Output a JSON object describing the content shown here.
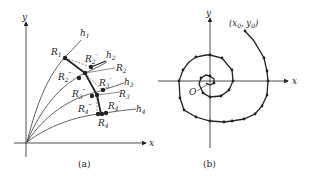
{
  "figure_a": {
    "caption": "(a)",
    "axis_x": "x",
    "axis_y": "y",
    "curves": [
      "h1",
      "h2",
      "h3",
      "h4"
    ],
    "curve_labels": [
      "h₁",
      "h₂",
      "h₃",
      "h₄"
    ],
    "points": [
      "R₁",
      "R₂′",
      "R₂″",
      "R₂",
      "R₃′",
      "R₃″",
      "R₃",
      "R₄″",
      "R₄′",
      "R₄"
    ]
  },
  "figure_b": {
    "caption": "(b)",
    "axis_x": "x",
    "axis_y": "y",
    "origin_label": "O",
    "start_label": "(x₀, y₀)"
  },
  "colors": {
    "ink": "#222222",
    "background": "#ffffff"
  }
}
